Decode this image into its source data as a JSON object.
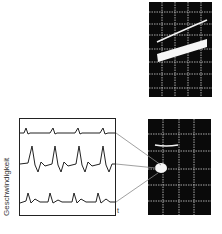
{
  "figure": {
    "y_axis_label": "Geschwindigkeit",
    "x_axis_label": "t",
    "traces": [
      {
        "name": "trace-top",
        "description": "small periodic peaks"
      },
      {
        "name": "trace-middle",
        "description": "large periodic peaks"
      },
      {
        "name": "trace-bottom",
        "description": "medium periodic peaks"
      }
    ],
    "scopes": [
      {
        "name": "oscilloscope-top",
        "content": "two rising sloped lines"
      },
      {
        "name": "oscilloscope-bottom",
        "content": "short horizontal line and bright spot"
      }
    ],
    "colors": {
      "scope_bg": "#0a0a0a",
      "grid": "#cfcfcf",
      "trace": "#222222",
      "connector": "#777777"
    }
  }
}
